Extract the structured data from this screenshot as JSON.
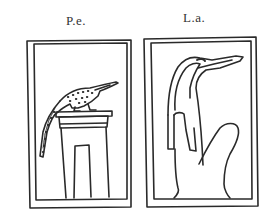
{
  "figures": [
    {
      "label": "P.e.",
      "depicts": "crocodile on shrine pedestal",
      "icon": "crocodile-on-shrine-icon"
    },
    {
      "label": "L.a.",
      "depicts": "crocodile-headed serpent figure",
      "icon": "crocodile-headed-figure-icon"
    }
  ],
  "colors": {
    "ink": "#2a2a2a",
    "background": "#ffffff"
  }
}
